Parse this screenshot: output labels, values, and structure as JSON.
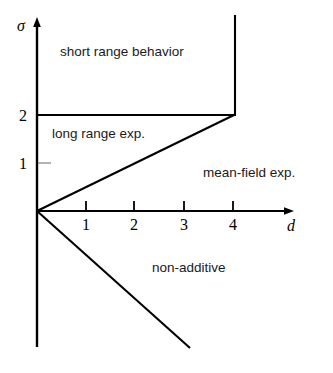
{
  "figure": {
    "type": "phase-diagram",
    "background_color": "#ffffff",
    "line_color": "#000000",
    "tick_color": "#7a7a7a"
  },
  "axes": {
    "x": {
      "label": "d",
      "origin_px": {
        "x": 37,
        "y": 211
      },
      "arrow_tip_px": {
        "x": 293,
        "y": 211
      },
      "label_px": {
        "x": 288,
        "y": 230
      },
      "ticks": [
        {
          "value": "1",
          "x_px": 86
        },
        {
          "value": "2",
          "x_px": 134
        },
        {
          "value": "3",
          "x_px": 184
        },
        {
          "value": "4",
          "x_px": 233
        }
      ],
      "tick_length_px": 10,
      "tick_direction": "up"
    },
    "y": {
      "label": "σ",
      "axis_x_px": 37,
      "arrow_tip_px": {
        "x": 37,
        "y": 18
      },
      "bottom_px": {
        "x": 37,
        "y": 347
      },
      "label_px": {
        "x": 17,
        "y": 31
      },
      "ticks": [
        {
          "value": "2",
          "y_px": 115,
          "label_px": {
            "x": 20,
            "y": 116
          },
          "marker": "major"
        },
        {
          "value": "1",
          "y_px": 163,
          "label_px": {
            "x": 20,
            "y": 169
          },
          "marker": "minor"
        }
      ]
    }
  },
  "boundaries": [
    {
      "name": "sigma-equals-2-line",
      "from_px": {
        "x": 37,
        "y": 115
      },
      "to_px": {
        "x": 235,
        "y": 115
      }
    },
    {
      "name": "d-equals-4-line",
      "from_px": {
        "x": 235,
        "y": 115
      },
      "to_px": {
        "x": 235,
        "y": 15
      }
    },
    {
      "name": "sigma-equals-d-over-2-line",
      "from_px": {
        "x": 37,
        "y": 211
      },
      "to_px": {
        "x": 235,
        "y": 115
      }
    },
    {
      "name": "non-additive-boundary-line",
      "from_px": {
        "x": 37,
        "y": 211
      },
      "to_px": {
        "x": 190,
        "y": 348
      }
    }
  ],
  "regions": [
    {
      "name": "short-range-behavior",
      "label": "short range behavior",
      "label_px": {
        "x": 60,
        "y": 56
      }
    },
    {
      "name": "long-range-exponents",
      "label": "long range exp.",
      "label_px": {
        "x": 52,
        "y": 138
      }
    },
    {
      "name": "mean-field-exponents",
      "label": "mean-field exp.",
      "label_px": {
        "x": 203,
        "y": 177
      }
    },
    {
      "name": "non-additive",
      "label": "non-additive",
      "label_px": {
        "x": 152,
        "y": 272
      }
    }
  ]
}
